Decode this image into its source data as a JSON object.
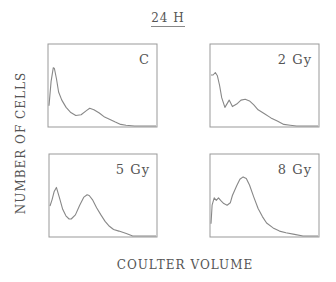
{
  "figure": {
    "title": "24 H",
    "ylabel": "NUMBER OF CELLS",
    "xlabel": "COULTER VOLUME",
    "line_color": "#888888",
    "frame_color": "#999999"
  },
  "chart_data": {
    "type": "line",
    "title": "24 H",
    "xlabel": "COULTER VOLUME",
    "ylabel": "NUMBER OF CELLS",
    "grid": false,
    "legend": "none",
    "layout": "2x2 small multiples",
    "note": "No numeric ticks shown; x and y are relative units (0-100) within each panel frame.",
    "xlim": [
      0,
      100
    ],
    "ylim": [
      0,
      100
    ],
    "panels": [
      {
        "name": "C",
        "label": "C",
        "box": {
          "x": 48,
          "y": 44,
          "w": 109,
          "h": 83
        },
        "x": [
          0,
          2,
          4,
          5,
          7,
          9,
          12,
          16,
          20,
          25,
          30,
          35,
          38,
          42,
          47,
          52,
          57,
          62,
          67,
          72,
          80,
          100
        ],
        "y": [
          25,
          55,
          72,
          71,
          58,
          42,
          32,
          23,
          17,
          13,
          14,
          19,
          22,
          20,
          16,
          11,
          8,
          5,
          2,
          1,
          0,
          0
        ]
      },
      {
        "name": "2 Gy",
        "label": "2 Gy",
        "box": {
          "x": 210,
          "y": 44,
          "w": 109,
          "h": 83
        },
        "x": [
          0,
          2,
          4,
          6,
          8,
          10,
          13,
          17,
          20,
          24,
          28,
          32,
          36,
          40,
          44,
          50,
          56,
          62,
          68,
          74,
          80,
          100
        ],
        "y": [
          63,
          63,
          66,
          62,
          50,
          35,
          23,
          32,
          24,
          27,
          32,
          33,
          31,
          26,
          20,
          15,
          10,
          6,
          2,
          1,
          0,
          0
        ]
      },
      {
        "name": "5 Gy",
        "label": "5 Gy",
        "box": {
          "x": 49,
          "y": 154,
          "w": 108,
          "h": 83
        },
        "x": [
          0,
          2,
          4,
          6,
          9,
          12,
          15,
          18,
          20,
          24,
          28,
          32,
          35,
          37,
          40,
          44,
          48,
          52,
          56,
          60,
          65,
          72,
          78,
          100
        ],
        "y": [
          37,
          45,
          55,
          60,
          47,
          33,
          25,
          21,
          21,
          26,
          38,
          48,
          51,
          50,
          45,
          35,
          26,
          18,
          12,
          8,
          6,
          3,
          0,
          0
        ]
      },
      {
        "name": "8 Gy",
        "label": "8 Gy",
        "box": {
          "x": 210,
          "y": 154,
          "w": 109,
          "h": 83
        },
        "x": [
          0,
          1,
          3,
          5,
          7,
          9,
          12,
          15,
          18,
          20,
          24,
          27,
          30,
          33,
          36,
          40,
          44,
          48,
          52,
          58,
          64,
          70,
          78,
          86,
          100
        ],
        "y": [
          15,
          38,
          47,
          44,
          47,
          44,
          40,
          38,
          41,
          50,
          62,
          70,
          73,
          71,
          63,
          48,
          34,
          24,
          16,
          10,
          6,
          4,
          2,
          0,
          0
        ]
      }
    ]
  }
}
